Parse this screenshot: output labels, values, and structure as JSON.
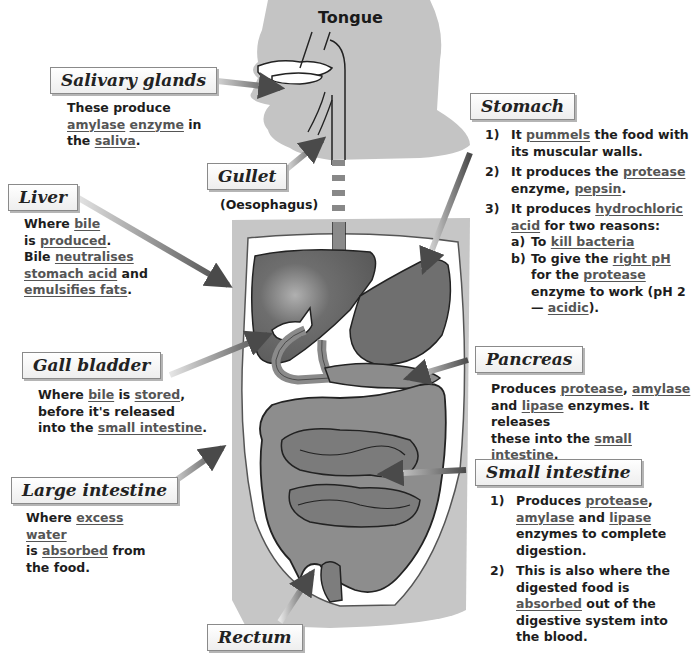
{
  "diagram": {
    "labels": {
      "tongue": "Tongue",
      "salivary": {
        "title": "Salivary glands",
        "text": [
          {
            "t": "These produce "
          },
          {
            "t": "amylase",
            "u": true
          },
          {
            "t": " "
          },
          {
            "t": "enzyme",
            "u": true
          },
          {
            "t": " in the "
          },
          {
            "t": "saliva",
            "u": true
          },
          {
            "t": "."
          }
        ]
      },
      "gullet": {
        "title": "Gullet",
        "subtitle": "(Oesophagus)"
      },
      "liver": {
        "title": "Liver",
        "text": [
          {
            "t": "Where "
          },
          {
            "t": "bile",
            "u": true
          },
          {
            "br": true
          },
          {
            "t": "is "
          },
          {
            "t": "produced",
            "u": true
          },
          {
            "t": "."
          },
          {
            "br": true
          },
          {
            "t": "Bile "
          },
          {
            "t": "neutralises",
            "u": true
          },
          {
            "br": true
          },
          {
            "t": "stomach acid",
            "u": true
          },
          {
            "t": " and"
          },
          {
            "br": true
          },
          {
            "t": "emulsifies fats",
            "u": true
          },
          {
            "t": "."
          }
        ]
      },
      "gall_bladder": {
        "title": "Gall bladder",
        "text": [
          {
            "t": "Where "
          },
          {
            "t": "bile",
            "u": true
          },
          {
            "t": " is "
          },
          {
            "t": "stored",
            "u": true
          },
          {
            "t": ","
          },
          {
            "br": true
          },
          {
            "t": "before it's released"
          },
          {
            "br": true
          },
          {
            "t": "into the "
          },
          {
            "t": "small intestine",
            "u": true
          },
          {
            "t": "."
          }
        ]
      },
      "large_intestine": {
        "title": "Large intestine",
        "text": [
          {
            "t": "Where "
          },
          {
            "t": "excess water",
            "u": true
          },
          {
            "br": true
          },
          {
            "t": "is "
          },
          {
            "t": "absorbed",
            "u": true
          },
          {
            "t": " from"
          },
          {
            "br": true
          },
          {
            "t": "the food."
          }
        ]
      },
      "rectum": {
        "title": "Rectum"
      },
      "stomach": {
        "title": "Stomach",
        "items": [
          {
            "num": "1)",
            "text": [
              {
                "t": "It "
              },
              {
                "t": "pummels",
                "u": true
              },
              {
                "t": " the food with its muscular walls."
              }
            ]
          },
          {
            "num": "2)",
            "text": [
              {
                "t": "It produces the "
              },
              {
                "t": "protease",
                "u": true
              },
              {
                "t": " enzyme, "
              },
              {
                "t": "pepsin",
                "u": true
              },
              {
                "t": "."
              }
            ]
          },
          {
            "num": "3)",
            "text": [
              {
                "t": "It produces "
              },
              {
                "t": "hydrochloric acid",
                "u": true
              },
              {
                "t": " for two reasons:"
              }
            ],
            "sub": [
              {
                "num": "a)",
                "text": [
                  {
                    "t": "To "
                  },
                  {
                    "t": "kill bacteria",
                    "u": true
                  }
                ]
              },
              {
                "num": "b)",
                "text": [
                  {
                    "t": "To give the "
                  },
                  {
                    "t": "right pH",
                    "u": true
                  },
                  {
                    "t": " for the "
                  },
                  {
                    "t": "protease",
                    "u": true
                  },
                  {
                    "t": " enzyme to work (pH 2 — "
                  },
                  {
                    "t": "acidic",
                    "u": true
                  },
                  {
                    "t": ")."
                  }
                ]
              }
            ]
          }
        ]
      },
      "pancreas": {
        "title": "Pancreas",
        "text": [
          {
            "t": "Produces "
          },
          {
            "t": "protease",
            "u": true
          },
          {
            "t": ", "
          },
          {
            "t": "amylase",
            "u": true
          },
          {
            "br": true
          },
          {
            "t": "and "
          },
          {
            "t": "lipase",
            "u": true
          },
          {
            "t": " enzymes.  It releases"
          },
          {
            "br": true
          },
          {
            "t": "these into the "
          },
          {
            "t": "small intestine",
            "u": true
          },
          {
            "t": "."
          }
        ]
      },
      "small_intestine": {
        "title": "Small intestine",
        "items": [
          {
            "num": "1)",
            "text": [
              {
                "t": "Produces "
              },
              {
                "t": "protease",
                "u": true
              },
              {
                "t": ", "
              },
              {
                "t": "amylase",
                "u": true
              },
              {
                "t": " and "
              },
              {
                "t": "lipase",
                "u": true
              },
              {
                "t": " enzymes to complete digestion."
              }
            ]
          },
          {
            "num": "2)",
            "text": [
              {
                "t": "This is also where the digested food is "
              },
              {
                "t": "absorbed",
                "u": true
              },
              {
                "t": " out of the digestive system into the blood."
              }
            ]
          }
        ]
      }
    },
    "colors": {
      "silhouette": "#c4c4c4",
      "organ_dark": "#6b6b6b",
      "organ_mid": "#8a8a8a",
      "abdomen_cavity": "#ffffff",
      "arrow": "#5a5a5a",
      "underline_text": "#555555"
    }
  }
}
